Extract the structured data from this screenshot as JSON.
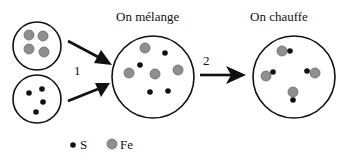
{
  "diagram": {
    "steps": [
      {
        "number": "1",
        "label": ""
      },
      {
        "number": "2",
        "label": ""
      }
    ],
    "stage_labels": {
      "mix": "On mélange",
      "heat": "On chauffe"
    },
    "legend": {
      "sulfur": {
        "symbol": "S",
        "icon": "black-dot-icon"
      },
      "iron": {
        "symbol": "Fe",
        "icon": "grey-dot-icon"
      }
    },
    "colors": {
      "sulfur": "#111111",
      "iron": "#8f8f8f",
      "iron_stroke": "#6a6a6a",
      "outline": "#111111"
    }
  }
}
